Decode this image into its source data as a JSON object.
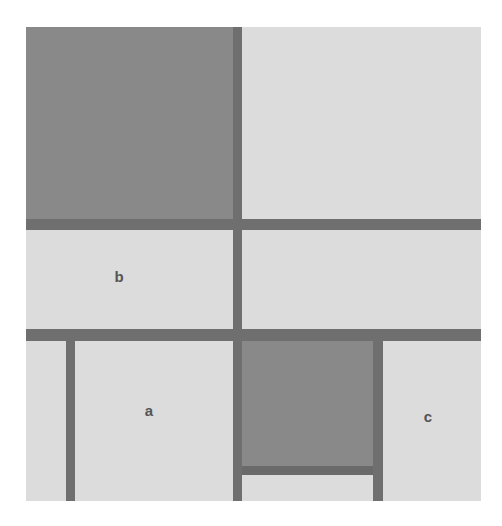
{
  "diagram": {
    "colors": {
      "background": "#ffffff",
      "light_panel": "#dcdcdc",
      "dark_panel": "#898989",
      "line": "#6f6f6f",
      "label": "#555555"
    },
    "labels": {
      "a": "a",
      "b": "b",
      "c": "c"
    }
  }
}
